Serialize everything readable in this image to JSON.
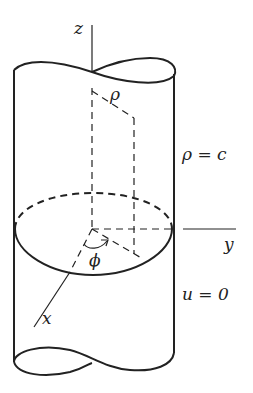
{
  "diagram": {
    "labels": {
      "z_axis": "z",
      "y_axis": "y",
      "x_axis": "x",
      "rho": "ρ",
      "phi": "ϕ",
      "boundary_surface": "ρ = c",
      "boundary_condition": "u = 0"
    },
    "colors": {
      "stroke": "#222222",
      "background": "#ffffff"
    }
  }
}
